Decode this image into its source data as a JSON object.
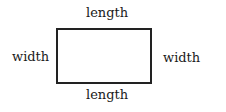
{
  "diagram": {
    "shape": "rectangle",
    "labels": {
      "top": "length",
      "bottom": "length",
      "left": "width",
      "right": "width"
    },
    "stroke_color": "#222222"
  }
}
